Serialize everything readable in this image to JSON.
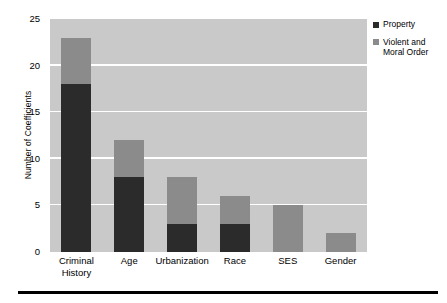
{
  "chart_data": {
    "type": "bar",
    "subtype": "stacked",
    "title": "",
    "xlabel": "",
    "ylabel": "Number of Coefficients",
    "ylim": [
      0,
      25
    ],
    "yticks": [
      0,
      5,
      10,
      15,
      20,
      25
    ],
    "ytick_labels": [
      "0",
      "5",
      "10",
      "15",
      "20",
      "25"
    ],
    "grid": "horizontal",
    "grid_color": "#ffffff",
    "plot_background": "#c9c9c9",
    "legend_position": "right",
    "categories": [
      "Criminal History",
      "Age",
      "Urbanization",
      "Race",
      "SES",
      "Gender"
    ],
    "category_labels": [
      "Criminal\nHistory",
      "Age",
      "Urbanization",
      "Race",
      "SES",
      "Gender"
    ],
    "series": [
      {
        "name": "Property",
        "color": "#2b2b2b",
        "values": [
          18,
          8,
          3,
          3,
          0,
          0
        ]
      },
      {
        "name": "Violent and Moral Order",
        "color": "#8b8b8b",
        "values": [
          5,
          4,
          5,
          3,
          5,
          2
        ]
      }
    ],
    "totals": [
      23,
      12,
      8,
      6,
      5,
      2
    ]
  },
  "legend": {
    "entries": [
      {
        "label": "Property",
        "color": "#2b2b2b"
      },
      {
        "label": "Violent and\nMoral Order",
        "color": "#8b8b8b"
      }
    ]
  }
}
